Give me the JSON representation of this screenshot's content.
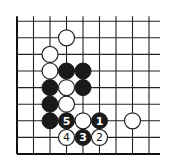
{
  "diagram": {
    "type": "go-board-fragment",
    "grid": {
      "columns": 9,
      "rows": 9,
      "origin_x": 17,
      "origin_y": 154,
      "spacing_x": 16.5,
      "spacing_y": 16.6,
      "open_top": true,
      "open_right": true,
      "edge_left": true,
      "edge_bottom": true
    },
    "colors": {
      "black_stone": "#1a1a1a",
      "white_stone": "#ffffff",
      "line": "#222222",
      "background": "#ffffff"
    },
    "stones": [
      {
        "color": "white",
        "col": 3,
        "row": 7,
        "label": ""
      },
      {
        "color": "white",
        "col": 2,
        "row": 6,
        "label": ""
      },
      {
        "color": "white",
        "col": 2,
        "row": 5,
        "label": ""
      },
      {
        "color": "black",
        "col": 3,
        "row": 5,
        "label": ""
      },
      {
        "color": "black",
        "col": 4,
        "row": 5,
        "label": ""
      },
      {
        "color": "black",
        "col": 2,
        "row": 4,
        "label": ""
      },
      {
        "color": "white",
        "col": 3,
        "row": 4,
        "label": ""
      },
      {
        "color": "black",
        "col": 4,
        "row": 4,
        "label": ""
      },
      {
        "color": "black",
        "col": 2,
        "row": 3,
        "label": ""
      },
      {
        "color": "white",
        "col": 3,
        "row": 3,
        "label": ""
      },
      {
        "color": "black",
        "col": 2,
        "row": 2,
        "label": ""
      },
      {
        "color": "black",
        "col": 3,
        "row": 2,
        "label": "5"
      },
      {
        "color": "white",
        "col": 4,
        "row": 2,
        "label": ""
      },
      {
        "color": "black",
        "col": 5,
        "row": 2,
        "label": "1"
      },
      {
        "color": "white",
        "col": 7,
        "row": 2,
        "label": ""
      },
      {
        "color": "white",
        "col": 3,
        "row": 1,
        "label": "4"
      },
      {
        "color": "black",
        "col": 4,
        "row": 1,
        "label": "3"
      },
      {
        "color": "white",
        "col": 5,
        "row": 1,
        "label": "2"
      }
    ],
    "move_labels": [
      "1",
      "2",
      "3",
      "4",
      "5"
    ]
  }
}
